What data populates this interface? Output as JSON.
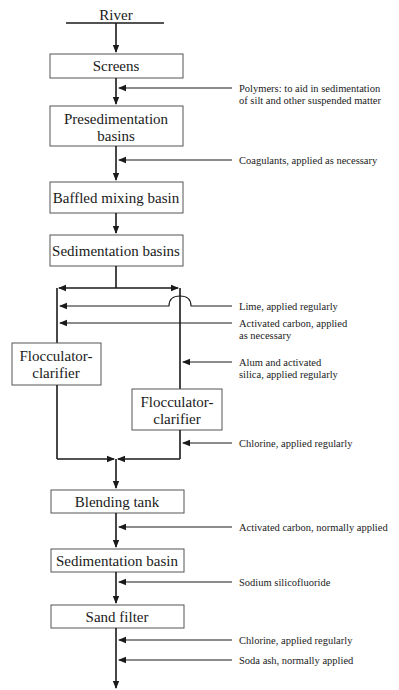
{
  "source": {
    "label": "River"
  },
  "processes": {
    "screens": "Screens",
    "presedimentation": [
      "Presedimentation",
      "basins"
    ],
    "baffled_mixing": "Baffled mixing basin",
    "sedimentation_basins": "Sedimentation basins",
    "flocculator_left": [
      "Flocculator-",
      "clarifier"
    ],
    "flocculator_right": [
      "Flocculator-",
      "clarifier"
    ],
    "blending_tank": "Blending tank",
    "sedimentation_basin": "Sedimentation basin",
    "sand_filter": "Sand filter"
  },
  "additives": {
    "polymers": [
      "Polymers:  to aid in sedimentation",
      "of silt and other suspended matter"
    ],
    "coagulants": "Coagulants, applied as necessary",
    "lime": "Lime, applied regularly",
    "activated_carbon_1": [
      "Activated carbon, applied",
      "as necessary"
    ],
    "alum_silica": [
      "Alum and activated",
      "silica, applied regularly"
    ],
    "chlorine_1": "Chlorine, applied regularly",
    "activated_carbon_2": "Activated carbon, normally applied",
    "sodium_silicofluoride": "Sodium silicofluoride",
    "chlorine_2": "Chlorine, applied regularly",
    "soda_ash": "Soda ash, normally applied"
  }
}
